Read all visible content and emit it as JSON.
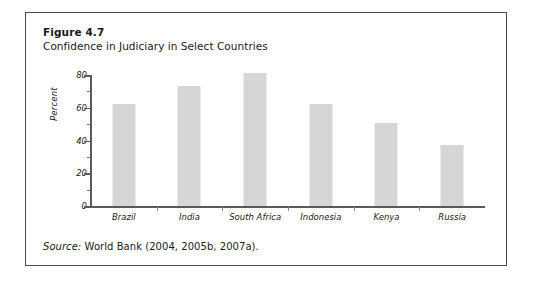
{
  "figure": {
    "number": "Figure 4.7",
    "caption": "Confidence in Judiciary in Select Countries",
    "source_prefix": "Source:",
    "source_text": " World Bank (2004, 2005b, 2007a)."
  },
  "style": {
    "bar_color": "#d6d6d6",
    "axis_color": "#5a5a5a",
    "border_color": "#4a4a4a",
    "text_color": "#1a1a1a"
  },
  "chart_data": {
    "type": "bar",
    "title": "Confidence in Judiciary in Select Countries",
    "xlabel": "",
    "ylabel": "Percent",
    "ylim": [
      0,
      80
    ],
    "yticks": [
      0,
      20,
      40,
      60,
      80
    ],
    "yticks_minor": [
      10,
      30,
      50,
      70
    ],
    "grid": false,
    "legend": "none",
    "categories": [
      "Brazil",
      "India",
      "South Africa",
      "Indonesia",
      "Kenya",
      "Russia"
    ],
    "values": [
      62,
      73,
      81,
      62,
      51,
      37
    ]
  }
}
